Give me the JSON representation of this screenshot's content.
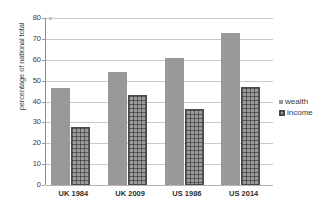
{
  "chart_data": {
    "type": "bar",
    "title": "",
    "subtitle": "",
    "xlabel": "",
    "ylabel": "percentage of national total",
    "categories": [
      "UK 1984",
      "UK 2009",
      "US 1986",
      "US 2014"
    ],
    "series": [
      {
        "name": "wealth",
        "values": [
          46.5,
          54,
          61,
          73
        ]
      },
      {
        "name": "income",
        "values": [
          28,
          43,
          36.5,
          47
        ]
      }
    ],
    "ylim": [
      0,
      80
    ],
    "yticks": [
      0,
      10,
      20,
      30,
      40,
      50,
      60,
      70,
      80
    ],
    "ytick_labels": [
      "0",
      "10",
      "20",
      "30",
      "40",
      "50",
      "60",
      "70",
      "80"
    ],
    "grid": true,
    "grid_axis": "y",
    "legend_position": "right",
    "legend": [
      "wealth",
      "income"
    ],
    "colors": {
      "wealth": "#999999",
      "income": "#9a9a9a",
      "income_border": "#4a4a4a",
      "gridline": "#c9c9c9",
      "axis": "#8f8f8f",
      "text": "#3a3a3a"
    }
  }
}
